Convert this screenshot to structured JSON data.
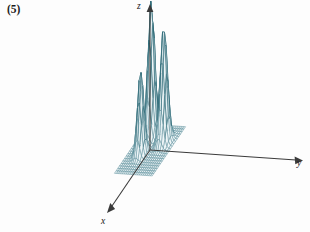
{
  "figure": {
    "label": "(5)",
    "caption": "",
    "background_color": "#ffffff"
  },
  "axes": {
    "z": {
      "label": "z",
      "direction": "up"
    },
    "y": {
      "label": "y",
      "direction": "right"
    },
    "x": {
      "label": "x",
      "direction": "lower-left"
    },
    "color": "#3a3a3a"
  },
  "style": {
    "mesh_color": "#5d8f9b",
    "mesh_highlight_color": "#2f6b78",
    "surface_fill": "#eef5f7",
    "line_width": 0.55
  },
  "chart_data": {
    "type": "surface",
    "title": "",
    "xlabel": "x",
    "ylabel": "y",
    "zlabel": "z",
    "grid": true,
    "legend": false,
    "projection": "3d-wireframe",
    "xlim": [
      -3,
      3
    ],
    "ylim": [
      -3,
      3
    ],
    "zlim": [
      0,
      1
    ],
    "grid_divisions_x": 20,
    "grid_divisions_y": 20,
    "peaks": [
      {
        "name": "peak-left",
        "x": -1.55,
        "y": -1.15,
        "height": 1.0,
        "sigma": 0.42
      },
      {
        "name": "peak-center",
        "x": 0.55,
        "y": -1.0,
        "height": 0.62,
        "sigma": 0.38
      },
      {
        "name": "peak-right",
        "x": -0.95,
        "y": 1.35,
        "height": 0.86,
        "sigma": 0.44
      }
    ],
    "base_level": 0.0
  },
  "a11y": {
    "plot_name": "three-peak-gaussian-surface"
  }
}
